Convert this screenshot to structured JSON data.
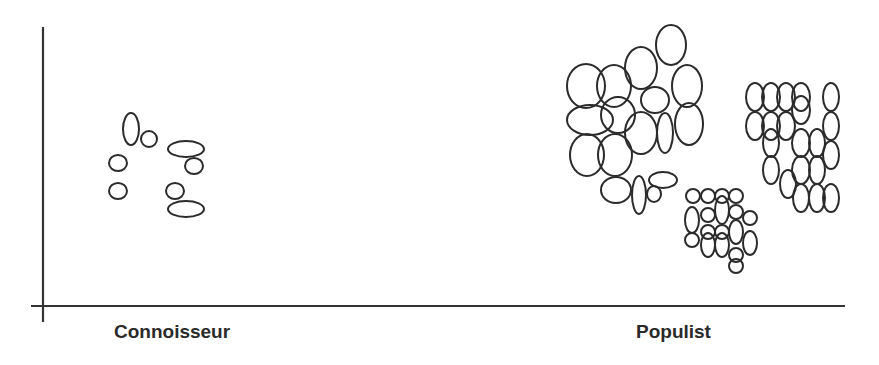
{
  "diagram": {
    "type": "cluster-scatter",
    "axis_labels": {
      "left": "Connoisseur",
      "right": "Populist"
    },
    "stroke_color": "#2b2b2b",
    "axis_color": "#333333",
    "clusters": [
      {
        "name": "connoisseur-cluster",
        "ellipses": [
          [
            131,
            129,
            8,
            16
          ],
          [
            149,
            139,
            8,
            8
          ],
          [
            186,
            149,
            18,
            8
          ],
          [
            194,
            166,
            9,
            8
          ],
          [
            118,
            163,
            9,
            8
          ],
          [
            118,
            191,
            9,
            8
          ],
          [
            175,
            191,
            9,
            8
          ],
          [
            186,
            209,
            18,
            8
          ]
        ]
      },
      {
        "name": "populist-large-cluster",
        "ellipses": [
          [
            671,
            45,
            15,
            20
          ],
          [
            586,
            86,
            19,
            22
          ],
          [
            614,
            86,
            17,
            21
          ],
          [
            641,
            68,
            16,
            21
          ],
          [
            687,
            86,
            15,
            21
          ],
          [
            590,
            120,
            23,
            15
          ],
          [
            618,
            115,
            17,
            18
          ],
          [
            655,
            100,
            14,
            13
          ],
          [
            641,
            133,
            16,
            21
          ],
          [
            665,
            133,
            8,
            20
          ],
          [
            689,
            124,
            14,
            21
          ],
          [
            587,
            155,
            17,
            21
          ],
          [
            615,
            155,
            17,
            21
          ],
          [
            616,
            190,
            15,
            13
          ],
          [
            639,
            195,
            7,
            19
          ],
          [
            663,
            180,
            14,
            8
          ],
          [
            654,
            194,
            7,
            8
          ]
        ]
      },
      {
        "name": "populist-right-cluster",
        "ellipses": [
          [
            755,
            97,
            9,
            14
          ],
          [
            771,
            97,
            9,
            14
          ],
          [
            786,
            97,
            9,
            14
          ],
          [
            801,
            97,
            9,
            14
          ],
          [
            831,
            97,
            8,
            14
          ],
          [
            755,
            126,
            9,
            14
          ],
          [
            771,
            126,
            9,
            14
          ],
          [
            786,
            126,
            9,
            14
          ],
          [
            801,
            110,
            9,
            14
          ],
          [
            817,
            143,
            8,
            14
          ],
          [
            831,
            126,
            8,
            14
          ],
          [
            771,
            143,
            8,
            14
          ],
          [
            801,
            143,
            9,
            14
          ],
          [
            771,
            170,
            8,
            14
          ],
          [
            788,
            184,
            8,
            14
          ],
          [
            801,
            170,
            9,
            14
          ],
          [
            817,
            170,
            8,
            14
          ],
          [
            831,
            155,
            8,
            14
          ],
          [
            801,
            198,
            8,
            14
          ],
          [
            817,
            198,
            8,
            14
          ],
          [
            831,
            198,
            8,
            14
          ]
        ]
      },
      {
        "name": "populist-bottom-cluster",
        "ellipses": [
          [
            693,
            196,
            7,
            7
          ],
          [
            708,
            196,
            7,
            7
          ],
          [
            722,
            196,
            7,
            7
          ],
          [
            736,
            196,
            7,
            7
          ],
          [
            692,
            220,
            7,
            13
          ],
          [
            708,
            215,
            7,
            7
          ],
          [
            722,
            210,
            7,
            14
          ],
          [
            736,
            212,
            7,
            7
          ],
          [
            708,
            232,
            7,
            7
          ],
          [
            722,
            232,
            7,
            7
          ],
          [
            736,
            232,
            7,
            12
          ],
          [
            750,
            218,
            7,
            7
          ],
          [
            692,
            240,
            7,
            7
          ],
          [
            708,
            245,
            7,
            12
          ],
          [
            722,
            245,
            7,
            12
          ],
          [
            750,
            243,
            7,
            12
          ],
          [
            736,
            255,
            7,
            7
          ],
          [
            736,
            266,
            7,
            7
          ]
        ]
      }
    ]
  }
}
